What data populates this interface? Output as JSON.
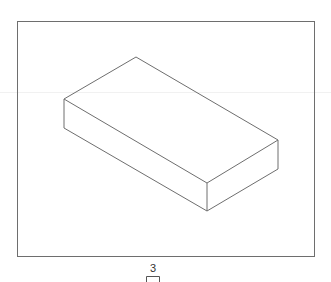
{
  "figure": {
    "type": "isometric-box-drawing",
    "frame": {
      "x": 17,
      "y": 21,
      "width": 297,
      "height": 235,
      "stroke": "#6e6e6e"
    },
    "box": {
      "stroke": "#6e6e6e",
      "vertices": {
        "top_back": [
          136,
          57
        ],
        "top_left": [
          64,
          99
        ],
        "top_right": [
          278,
          140
        ],
        "top_front": [
          207,
          183
        ],
        "bottom_left": [
          64,
          128
        ],
        "bottom_right": [
          278,
          169
        ],
        "bottom_front": [
          207,
          211
        ]
      }
    },
    "page_label": "3"
  }
}
